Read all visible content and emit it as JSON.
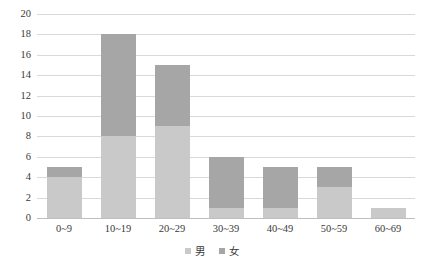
{
  "chart_data": {
    "type": "bar",
    "subtype": "stacked-column",
    "title": "",
    "xlabel": "",
    "ylabel": "",
    "categories": [
      "0~9",
      "10~19",
      "20~29",
      "30~39",
      "40~49",
      "50~59",
      "60~69"
    ],
    "series": [
      {
        "name": "男",
        "color": "#c9c9c9",
        "values": [
          4,
          8,
          9,
          1,
          1,
          3,
          1
        ]
      },
      {
        "name": "女",
        "color": "#a6a6a6",
        "values": [
          1,
          10,
          6,
          5,
          4,
          2,
          0
        ]
      }
    ],
    "totals": [
      5,
      18,
      15,
      6,
      5,
      5,
      1
    ],
    "ylim": [
      0,
      20
    ],
    "y_ticks": [
      0,
      2,
      4,
      6,
      8,
      10,
      12,
      14,
      16,
      18,
      20
    ],
    "y_tick_labels": [
      "0",
      "2",
      "4",
      "6",
      "8",
      "10",
      "12",
      "14",
      "16",
      "18",
      "20"
    ],
    "grid": true,
    "grid_color": "#d9d9d9",
    "legend_position": "bottom",
    "legend_entries": [
      "男",
      "女"
    ],
    "background": "#ffffff"
  }
}
